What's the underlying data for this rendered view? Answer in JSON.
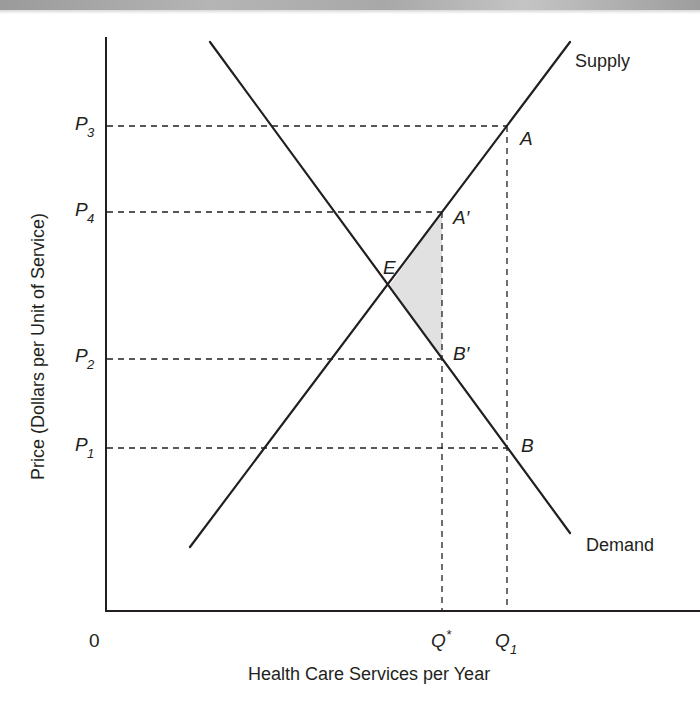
{
  "diagram": {
    "type": "supply-demand",
    "x_axis": {
      "title": "Health Care Services per Year",
      "origin_label": "0",
      "ticks": [
        {
          "id": "q_star",
          "base": "Q",
          "sup": "*",
          "sub": ""
        },
        {
          "id": "q1",
          "base": "Q",
          "sup": "",
          "sub": "1"
        }
      ]
    },
    "y_axis": {
      "title": "Price (Dollars per Unit of Service)",
      "ticks": [
        {
          "id": "p3",
          "base": "P",
          "sub": "3"
        },
        {
          "id": "p4",
          "base": "P",
          "sub": "4"
        },
        {
          "id": "p2",
          "base": "P",
          "sub": "2"
        },
        {
          "id": "p1",
          "base": "P",
          "sub": "1"
        }
      ]
    },
    "curves": {
      "supply_label": "Supply",
      "demand_label": "Demand"
    },
    "points": {
      "E": "E",
      "A": "A",
      "A_prime": "A′",
      "B": "B",
      "B_prime": "B′"
    },
    "shaded_region": "triangle E–A′–B′ (deadweight loss)",
    "colors": {
      "line": "#231f20",
      "shade": "#e1e1e1",
      "background": "#ffffff"
    }
  }
}
